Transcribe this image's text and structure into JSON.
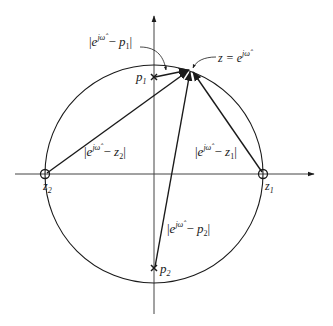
{
  "diagram": {
    "type": "z-plane pole-zero vector diagram",
    "colors": {
      "stroke": "#1a1a1a",
      "background": "#ffffff"
    },
    "unit_circle": {
      "cx": 154,
      "cy": 174,
      "r": 109
    },
    "axes": {
      "real": {
        "x1": 15,
        "x2": 314,
        "y": 174,
        "arrow": "right"
      },
      "imag": {
        "x": 154,
        "y1": 16,
        "y2": 314,
        "arrow": "up"
      }
    },
    "point_on_circle": {
      "x": 191,
      "y": 70,
      "label": "z = e",
      "label_sup": "jω̂"
    },
    "zeros": [
      {
        "name": "z1",
        "label_main": "z",
        "label_sub": "1",
        "x": 263,
        "y": 174
      },
      {
        "name": "z2",
        "label_main": "z",
        "label_sub": "2",
        "x": 45,
        "y": 174
      }
    ],
    "poles": [
      {
        "name": "p1",
        "label_main": "p",
        "label_sub": "1",
        "x": 154,
        "y": 77
      },
      {
        "name": "p2",
        "label_main": "p",
        "label_sub": "2",
        "x": 154,
        "y": 268
      }
    ],
    "vector_labels": {
      "p1": {
        "base": "e",
        "sup": "jω̂",
        "minus": " − ",
        "var": "p",
        "sub": "1"
      },
      "z2": {
        "base": "e",
        "sup": "jω̂",
        "minus": " − ",
        "var": "z",
        "sub": "2"
      },
      "z1": {
        "base": "e",
        "sup": "jω̂",
        "minus": " − ",
        "var": "z",
        "sub": "1"
      },
      "p2": {
        "base": "e",
        "sup": "jω̂",
        "minus": " − ",
        "var": "p",
        "sub": "2"
      }
    },
    "bar": "|"
  }
}
